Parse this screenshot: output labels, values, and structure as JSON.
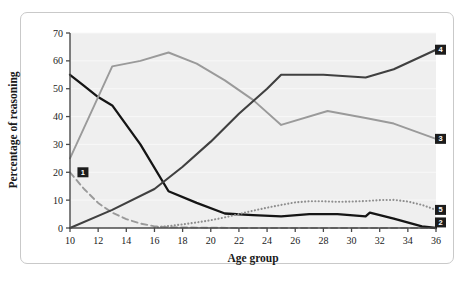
{
  "figure": {
    "background": "#ffffff",
    "frame_border_color": "#c9c9c9",
    "plot_background": "#efefef",
    "gridline_color": "#f8f8f8",
    "axis_color": "#4a4a4a",
    "badge_background": "#1c1c1c",
    "badge_text_color": "#ffffff"
  },
  "chart_data": {
    "type": "line",
    "title": "",
    "xlabel": "Age group",
    "ylabel": "Percentage of reasoning",
    "xlim": [
      10,
      36
    ],
    "ylim": [
      0,
      70
    ],
    "xticks": [
      10,
      12,
      14,
      16,
      18,
      20,
      22,
      24,
      26,
      28,
      30,
      32,
      34,
      36
    ],
    "yticks": [
      0,
      10,
      20,
      30,
      40,
      50,
      60,
      70
    ],
    "xtick_labels": [
      "10",
      "12",
      "14",
      "16",
      "18",
      "20",
      "22",
      "24",
      "26",
      "28",
      "30",
      "32",
      "34",
      "36"
    ],
    "ytick_labels": [
      "0",
      "10",
      "20",
      "30",
      "40",
      "50",
      "60",
      "70"
    ],
    "grid": true,
    "grid_axis": "y",
    "legend_position": "right-inline-badges",
    "series": [
      {
        "name": "1",
        "label": "1",
        "style": "dashed",
        "color": "#9a9a9a",
        "width": 1.9,
        "label_x": 10.6,
        "label_y": 20,
        "x": [
          10,
          11,
          12,
          13,
          14,
          15,
          16,
          17,
          18,
          20,
          22,
          24,
          26,
          28,
          30,
          32,
          34,
          36
        ],
        "y": [
          20,
          14,
          9,
          5.5,
          3.2,
          1.6,
          0.6,
          0.3,
          0.2,
          0.1,
          0,
          0,
          0,
          0,
          0,
          0,
          0,
          0
        ]
      },
      {
        "name": "2",
        "label": "2",
        "style": "solid",
        "color": "#151515",
        "width": 2.3,
        "label_x": 36,
        "label_y": 2,
        "x": [
          10,
          11,
          12,
          13,
          15,
          17,
          19,
          21,
          23,
          25,
          27,
          29,
          31,
          31.3,
          33,
          35,
          36
        ],
        "y": [
          55,
          51,
          47,
          44,
          30,
          13.2,
          9,
          5.2,
          4.6,
          4.2,
          5,
          5,
          4.2,
          5.5,
          3.4,
          0.6,
          0
        ]
      },
      {
        "name": "3",
        "label": "3",
        "style": "solid",
        "color": "#9a9a9a",
        "width": 1.9,
        "label_x": 36,
        "label_y": 32,
        "x": [
          10,
          13,
          15,
          17,
          19,
          21,
          23,
          25,
          28.3,
          31,
          33,
          36
        ],
        "y": [
          25,
          58,
          60,
          63,
          59,
          53,
          46,
          37,
          42,
          39.5,
          37.5,
          32
        ]
      },
      {
        "name": "4",
        "label": "4",
        "style": "solid",
        "color": "#404040",
        "width": 2.1,
        "label_x": 36,
        "label_y": 64,
        "x": [
          10,
          13,
          16,
          18,
          20,
          22,
          24,
          25,
          28,
          31,
          33,
          36
        ],
        "y": [
          0,
          6.5,
          14,
          22,
          31,
          41,
          50,
          55,
          55,
          54,
          57,
          64
        ]
      },
      {
        "name": "5",
        "label": "5",
        "style": "dotted",
        "color": "#8f8f8f",
        "width": 2.1,
        "label_x": 36,
        "label_y": 6.5,
        "x": [
          16,
          17,
          18,
          19,
          20,
          21,
          22,
          23,
          24,
          25,
          26,
          27,
          28,
          29,
          30,
          31,
          32,
          33,
          34,
          35,
          36
        ],
        "y": [
          0.2,
          0.7,
          1.3,
          2.0,
          2.8,
          3.8,
          5.0,
          6.2,
          7.3,
          8.3,
          9.2,
          9.6,
          9.6,
          9.4,
          9.5,
          9.7,
          10.0,
          10.1,
          9.5,
          8.3,
          6.5
        ]
      }
    ]
  }
}
